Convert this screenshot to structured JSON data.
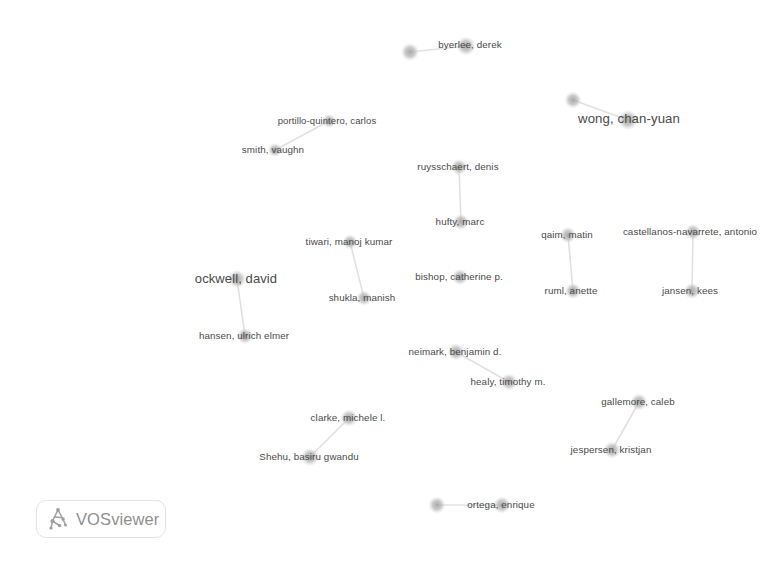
{
  "app": {
    "name": "VOSviewer",
    "visualization_type": "co-authorship network map",
    "background_color": "#ffffff",
    "node_color": "#b9b9b9",
    "label_color": "#4a4a4a",
    "edge_color": "#dcdcdc"
  },
  "logo": {
    "text": "VOSviewer",
    "icon": "vosviewer-logo-icon",
    "text_color": "#8f8f8f"
  },
  "network": {
    "width": 779,
    "height": 570,
    "nodes": [
      {
        "id": "n1",
        "label": "",
        "x": 410,
        "y": 52,
        "r": 9.0,
        "label_x": 0,
        "label_y": 0,
        "font": 0
      },
      {
        "id": "n2",
        "label": "byerlee, derek",
        "x": 466,
        "y": 46,
        "r": 9.5,
        "label_x": 470,
        "label_y": 44,
        "font": 9.8
      },
      {
        "id": "n3",
        "label": "",
        "x": 573,
        "y": 100,
        "r": 8.5,
        "label_x": 0,
        "label_y": 0,
        "font": 0
      },
      {
        "id": "n4",
        "label": "wong, chan-yuan",
        "x": 628,
        "y": 120,
        "r": 10.0,
        "label_x": 629,
        "label_y": 118,
        "font": 13.2
      },
      {
        "id": "n5",
        "label": "portillo-quintero, carlos",
        "x": 329,
        "y": 121,
        "r": 7.0,
        "label_x": 327,
        "label_y": 120,
        "font": 9.5
      },
      {
        "id": "n6",
        "label": "smith, vaughn",
        "x": 275,
        "y": 150,
        "r": 7.0,
        "label_x": 273,
        "label_y": 149,
        "font": 9.8
      },
      {
        "id": "n7",
        "label": "ruysschaert, denis",
        "x": 459,
        "y": 167,
        "r": 8.0,
        "label_x": 458,
        "label_y": 166,
        "font": 9.8
      },
      {
        "id": "n8",
        "label": "hufty, marc",
        "x": 461,
        "y": 222,
        "r": 8.0,
        "label_x": 460,
        "label_y": 221,
        "font": 9.8
      },
      {
        "id": "n9",
        "label": "tiwari, manoj kumar",
        "x": 350,
        "y": 242,
        "r": 7.5,
        "label_x": 349,
        "label_y": 241,
        "font": 9.8
      },
      {
        "id": "n10",
        "label": "shukla, manish",
        "x": 364,
        "y": 298,
        "r": 7.5,
        "label_x": 362,
        "label_y": 297,
        "font": 9.8
      },
      {
        "id": "n11",
        "label": "ockwell, david",
        "x": 237,
        "y": 279,
        "r": 9.0,
        "label_x": 236,
        "label_y": 278,
        "font": 13.0
      },
      {
        "id": "n12",
        "label": "hansen, ulrich elmer",
        "x": 245,
        "y": 336,
        "r": 8.0,
        "label_x": 244,
        "label_y": 335,
        "font": 9.8
      },
      {
        "id": "n13",
        "label": "bishop, catherine p.",
        "x": 460,
        "y": 277,
        "r": 8.0,
        "label_x": 459,
        "label_y": 276,
        "font": 9.8
      },
      {
        "id": "n14",
        "label": "qaim, matin",
        "x": 568,
        "y": 235,
        "r": 8.0,
        "label_x": 567,
        "label_y": 234,
        "font": 9.8
      },
      {
        "id": "n15",
        "label": "ruml, anette",
        "x": 573,
        "y": 291,
        "r": 8.0,
        "label_x": 571,
        "label_y": 290,
        "font": 9.8
      },
      {
        "id": "n16",
        "label": "castellanos-navarrete, antonio",
        "x": 693,
        "y": 232,
        "r": 8.0,
        "label_x": 690,
        "label_y": 231,
        "font": 9.8
      },
      {
        "id": "n17",
        "label": "jansen, kees",
        "x": 692,
        "y": 291,
        "r": 8.0,
        "label_x": 690,
        "label_y": 290,
        "font": 9.8
      },
      {
        "id": "n18",
        "label": "neimark, benjamin d.",
        "x": 456,
        "y": 352,
        "r": 8.5,
        "label_x": 455,
        "label_y": 351,
        "font": 9.8
      },
      {
        "id": "n19",
        "label": "healy, timothy m.",
        "x": 509,
        "y": 382,
        "r": 8.5,
        "label_x": 508,
        "label_y": 381,
        "font": 9.8
      },
      {
        "id": "n20",
        "label": "gallemore, caleb",
        "x": 639,
        "y": 402,
        "r": 8.5,
        "label_x": 638,
        "label_y": 401,
        "font": 9.8
      },
      {
        "id": "n21",
        "label": "jespersen, kristjan",
        "x": 612,
        "y": 450,
        "r": 8.5,
        "label_x": 611,
        "label_y": 449,
        "font": 9.8
      },
      {
        "id": "n22",
        "label": "clarke, michele l.",
        "x": 349,
        "y": 418,
        "r": 8.5,
        "label_x": 348,
        "label_y": 417,
        "font": 9.8
      },
      {
        "id": "n23",
        "label": "Shehu, basiru gwandu",
        "x": 310,
        "y": 457,
        "r": 9.0,
        "label_x": 309,
        "label_y": 456,
        "font": 9.8
      },
      {
        "id": "n24",
        "label": "",
        "x": 437,
        "y": 505,
        "r": 8.5,
        "label_x": 0,
        "label_y": 0,
        "font": 0
      },
      {
        "id": "n25",
        "label": "ortega, enrique",
        "x": 502,
        "y": 505,
        "r": 8.5,
        "label_x": 501,
        "label_y": 504,
        "font": 9.8
      }
    ],
    "edges": [
      {
        "source": "n1",
        "target": "n2"
      },
      {
        "source": "n3",
        "target": "n4"
      },
      {
        "source": "n5",
        "target": "n6"
      },
      {
        "source": "n7",
        "target": "n8"
      },
      {
        "source": "n9",
        "target": "n10"
      },
      {
        "source": "n11",
        "target": "n12"
      },
      {
        "source": "n14",
        "target": "n15"
      },
      {
        "source": "n16",
        "target": "n17"
      },
      {
        "source": "n18",
        "target": "n19"
      },
      {
        "source": "n20",
        "target": "n21"
      },
      {
        "source": "n22",
        "target": "n23"
      },
      {
        "source": "n24",
        "target": "n25"
      }
    ]
  }
}
